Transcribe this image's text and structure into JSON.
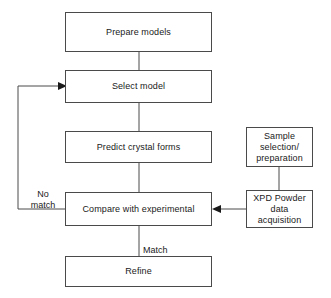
{
  "diagram": {
    "stroke_color": "#4a4a4a",
    "text_color": "#1a1a1a",
    "background_color": "#ffffff",
    "nodes": [
      {
        "id": "prepare-models",
        "label": "Prepare models"
      },
      {
        "id": "select-model",
        "label": "Select model"
      },
      {
        "id": "predict-forms",
        "label": "Predict crystal forms"
      },
      {
        "id": "compare",
        "label": "Compare with experimental"
      },
      {
        "id": "refine",
        "label": "Refine"
      },
      {
        "id": "sample",
        "label": "Sample\nselection/\npreparation"
      },
      {
        "id": "xpd",
        "label": "XPD Powder\ndata\nacquisition"
      }
    ],
    "edge_labels": [
      {
        "id": "no-match",
        "label": "No\nmatch"
      },
      {
        "id": "match",
        "label": "Match"
      }
    ]
  }
}
